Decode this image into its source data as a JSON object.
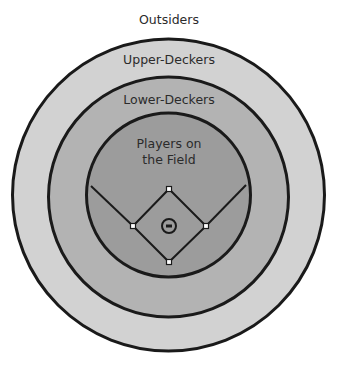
{
  "diagram": {
    "type": "concentric-circles",
    "labels": {
      "outsiders": "Outsiders",
      "upper_deckers": "Upper-Deckers",
      "lower_deckers": "Lower-Deckers",
      "players_line1": "Players on",
      "players_line2": "the Field"
    },
    "rings": [
      {
        "name": "upper-deckers",
        "cx": 168.5,
        "cy": 195,
        "r": 156,
        "fill": "#d2d2d2"
      },
      {
        "name": "lower-deckers",
        "cx": 168.5,
        "cy": 197,
        "r": 120,
        "fill": "#b3b3b3"
      },
      {
        "name": "players-on-the-field",
        "cx": 168.5,
        "cy": 195,
        "r": 82,
        "fill": "#9c9c9c"
      }
    ],
    "stroke_color": "#1a1a1a",
    "background": "#ffffff",
    "field": {
      "home_plate": [
        169,
        262
      ],
      "first_base": [
        206,
        226
      ],
      "second_base": [
        169,
        189
      ],
      "third_base": [
        133,
        226
      ],
      "pitcher": [
        169,
        226
      ],
      "left_foul_end": [
        91,
        186
      ],
      "right_foul_end": [
        246,
        185
      ]
    }
  }
}
